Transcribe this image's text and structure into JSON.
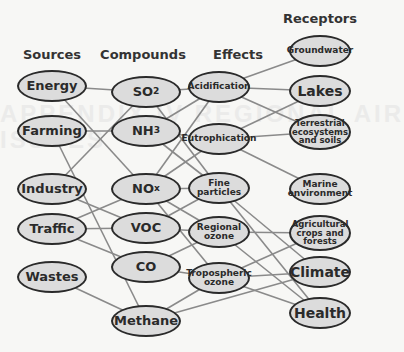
{
  "background_text": [
    "APPENDIX IV REGIONAL AIR",
    "ISSUES"
  ],
  "headers": {
    "sources": "Sources",
    "compounds": "Compounds",
    "effects": "Effects",
    "receptors": "Receptors"
  },
  "sources": [
    {
      "id": "energy",
      "label": "Energy",
      "x": 52,
      "y": 86
    },
    {
      "id": "farming",
      "label": "Farming",
      "x": 52,
      "y": 131
    },
    {
      "id": "industry",
      "label": "Industry",
      "x": 52,
      "y": 189
    },
    {
      "id": "traffic",
      "label": "Traffic",
      "x": 52,
      "y": 229
    },
    {
      "id": "wastes",
      "label": "Wastes",
      "x": 52,
      "y": 277
    }
  ],
  "compounds": [
    {
      "id": "so2",
      "label": "SO",
      "sub": "2",
      "x": 146,
      "y": 92
    },
    {
      "id": "nh3",
      "label": "NH",
      "sub": "3",
      "x": 146,
      "y": 131
    },
    {
      "id": "nox",
      "label": "NO",
      "sub": "x",
      "x": 146,
      "y": 189
    },
    {
      "id": "voc",
      "label": "VOC",
      "sub": "",
      "x": 146,
      "y": 228
    },
    {
      "id": "co",
      "label": "CO",
      "sub": "",
      "x": 146,
      "y": 267
    },
    {
      "id": "methane",
      "label": "Methane",
      "sub": "",
      "x": 146,
      "y": 321
    }
  ],
  "effects": [
    {
      "id": "acid",
      "label": "Acidification",
      "x": 219,
      "y": 87
    },
    {
      "id": "eutro",
      "label": "Eutrophication",
      "x": 219,
      "y": 139
    },
    {
      "id": "fine",
      "label": "Fine particles",
      "x": 219,
      "y": 188
    },
    {
      "id": "regoz",
      "label": "Regional ozone",
      "x": 219,
      "y": 232
    },
    {
      "id": "tropoz",
      "label": "Tropospheric ozone",
      "x": 219,
      "y": 278
    }
  ],
  "receptors": [
    {
      "id": "ground",
      "label": "Groundwater",
      "x": 320,
      "y": 51
    },
    {
      "id": "lakes",
      "label": "Lakes",
      "x": 320,
      "y": 91
    },
    {
      "id": "terr",
      "label": "Terrestrial ecosystems and soils",
      "x": 320,
      "y": 132
    },
    {
      "id": "marine",
      "label": "Marine environment",
      "x": 320,
      "y": 189
    },
    {
      "id": "agri",
      "label": "Agricultural crops and forests",
      "x": 320,
      "y": 233
    },
    {
      "id": "climate",
      "label": "Climate",
      "x": 320,
      "y": 272
    },
    {
      "id": "health",
      "label": "Health",
      "x": 320,
      "y": 313
    }
  ],
  "edges": [
    [
      "energy",
      "so2"
    ],
    [
      "energy",
      "nox"
    ],
    [
      "farming",
      "nh3"
    ],
    [
      "farming",
      "methane"
    ],
    [
      "industry",
      "so2"
    ],
    [
      "industry",
      "voc"
    ],
    [
      "traffic",
      "nox"
    ],
    [
      "traffic",
      "voc"
    ],
    [
      "traffic",
      "co"
    ],
    [
      "wastes",
      "methane"
    ],
    [
      "so2",
      "acid"
    ],
    [
      "so2",
      "fine"
    ],
    [
      "nh3",
      "acid"
    ],
    [
      "nh3",
      "eutro"
    ],
    [
      "nh3",
      "fine"
    ],
    [
      "nox",
      "acid"
    ],
    [
      "nox",
      "eutro"
    ],
    [
      "nox",
      "fine"
    ],
    [
      "nox",
      "regoz"
    ],
    [
      "nox",
      "tropoz"
    ],
    [
      "voc",
      "regoz"
    ],
    [
      "voc",
      "fine"
    ],
    [
      "co",
      "regoz"
    ],
    [
      "co",
      "tropoz"
    ],
    [
      "methane",
      "tropoz"
    ],
    [
      "methane",
      "climate"
    ],
    [
      "acid",
      "ground"
    ],
    [
      "acid",
      "lakes"
    ],
    [
      "acid",
      "terr"
    ],
    [
      "eutro",
      "lakes"
    ],
    [
      "eutro",
      "terr"
    ],
    [
      "eutro",
      "marine"
    ],
    [
      "fine",
      "climate"
    ],
    [
      "fine",
      "health"
    ],
    [
      "regoz",
      "agri"
    ],
    [
      "regoz",
      "health"
    ],
    [
      "tropoz",
      "agri"
    ],
    [
      "tropoz",
      "climate"
    ],
    [
      "tropoz",
      "health"
    ]
  ],
  "colors": {
    "edge": "#8a8a8a",
    "node_fill": "#dcdcdc",
    "node_border": "#2a2a2a",
    "text": "#2a2a2a"
  }
}
